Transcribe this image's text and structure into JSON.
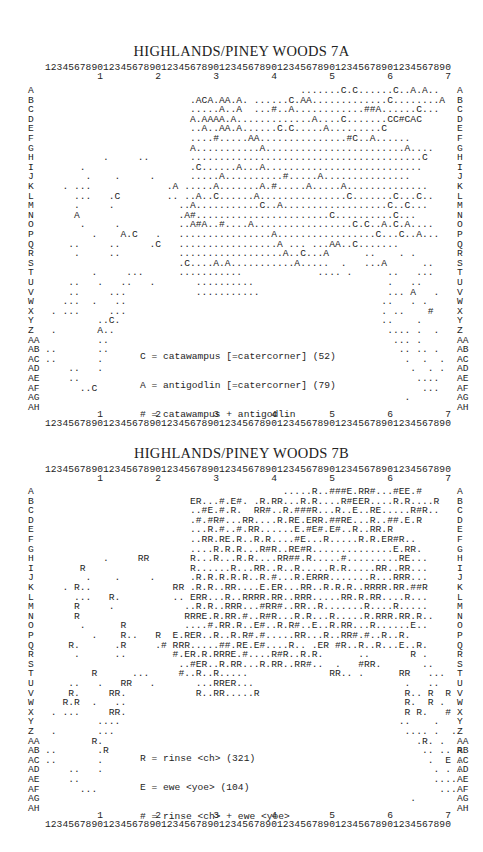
{
  "panels": [
    {
      "title": "HIGHLANDS/PINEY WOODS 7A",
      "axis_digits": "1234567890123456789012345678901234567890123456789012345678901234567890",
      "axis_tens": "         1         2         3         4         5         6         7",
      "row_labels": [
        "A",
        "B",
        "C",
        "D",
        "E",
        "F",
        "G",
        "H",
        "I",
        "J",
        "K",
        "L",
        "M",
        "N",
        "O",
        "P",
        "Q",
        "R",
        "S",
        "T",
        "U",
        "V",
        "W",
        "X",
        "Y",
        "Z",
        "AA",
        "AB",
        "AC",
        "AD",
        "AE",
        "AF",
        "AG",
        "AH"
      ],
      "rows": [
        "                                            .......C.C......C..A.A..   ",
        "                         .ACA.AA.A. ......C.AA.............C........A  ",
        "                         .....A..A  ...#..A............##A......C...   ",
        "                         A.AAAA.A.............A....C.......CC#CAC      ",
        "                         ..A..AA.A......C.C.....A.........C            ",
        "                         ....#.....AA...............#C..A......        ",
        "                         A...........A........................A....    ",
        "          .     ..       ........................................C     ",
        "      .                  .C......A...A...........................      ",
        "       .    .     .      .....A..........#.....A...............        ",
        "   . ...             .A .....A.......A.#.....A.....A..............     ",
        "     ...   .C        .. ..A..C......A...............C.......C...C..    ",
        "     .     .           ..A...........C..A..................C..C...     ",
        "     A                 .A#.......................C..........C...       ",
        "      .     .          ..A#A..#....A.................C.C..A.C.A....    ",
        "        .    A.C   .   ................A.................C...C..A...   ",
        "    ..     ..     .C   .................A ... ...AA..C.......          ",
        "     .     ..          ..................A..C...A      ..    . .       ",
        "                       .C....A.A...........A.....  .   ...A      ..    ",
        "        .     ...      ...........             .... .      ..   ...   ",
        "    ..   .   ..   .       ..........                       .   ..     ",
        "    ..     ...            ...........                      ... A   .  ",
        "   ...  .   ..                                            ..   . .    ",
        " . ...     ...                                            . ..    #   ",
        "         ..C.                                             ..    .     ",
        " .       A..                                               .... .  .  ",
        "         ..                                                 ... .     ",
        "..       ..                                                  .. .. .  ",
        "..       .                                                    .  .  . ",
        "    ..   .                                                     .  . . ",
        "    ..                                                          ....  ",
        "      ..C                                                        ...  ",
        "                                                              .       ",
        "                                                                      "
      ],
      "bottom_stray": ".",
      "legend": [
        {
          "symbol": "C",
          "text": "C = catawampus [=catercorner] (52)"
        },
        {
          "symbol": "A",
          "text": "A = antigodlin [=catercorner] (79)"
        },
        {
          "symbol": "#",
          "text": "# = catawampus + antigodlin"
        }
      ]
    },
    {
      "title": "HIGHLANDS/PINEY WOODS 7B",
      "axis_digits": "1234567890123456789012345678901234567890123456789012345678901234567890",
      "axis_tens": "         1         2         3         4         5         6         7",
      "row_labels": [
        "A",
        "B",
        "C",
        "D",
        "E",
        "F",
        "G",
        "H",
        "I",
        "J",
        "K",
        "L",
        "M",
        "N",
        "O",
        "P",
        "Q",
        "R",
        "S",
        "T",
        "U",
        "V",
        "W",
        "X",
        "Y",
        "Z",
        "AA",
        "AB",
        "AC",
        "AD",
        "AE",
        "AF",
        "AG",
        "AH"
      ],
      "rows": [
        "                                         .....R..###E.RR#...#EE.#      ",
        "                         ER...#.E#. .R.RR...R.R....R#EER....R.R....R   ",
        "                         ..#E.#.R.  RR#..R.###R...R..E..RE.....R#R..   ",
        "                         .#.#R#...RR....R.RE.ERR.##RE...R..##.E.R      ",
        "                         ...R.#..#.RR......E.#E#.E#..R..RR.R           ",
        "                         ..RR.RE.R..R.R....#E...R.....R.R.ER#R..       ",
        "                         ....R.R.R...R#R..RE#R..............E.RR.      ",
        "          .     RR       R...R...R.R....RR##.R.....#.........RE...     ",
        "      R                  R......R...RR..R..R.....R.R.....RR..RR...     ",
        "       .    .     .      .R.R.R.R.R..R.#...R.ERRR.......R...RRR...     ",
        "   . R..              RR .R.R..RR....E.ER...RR..R.R.R..RRRR.RR.##R     ",
        "     ...   R.         .. ERR...R..RRRR.RR..RRR.....RR.R.RR....R...     ",
        "     R     .            ..R.R..RRR...#RR#..RR..R.......R....R.....    ",
        "     R                  RRRE.R.RR.#..R#R...R.R...R.....R.RRR.RR.R..    ",
        "      .      R          ....#.RR.R..E#..R.R#..E..R.RR...R......E..     ",
        "        .    R..   R  E.RER..R..R.R#.#.....RR...R..RR#.#..R..R.        ",
        "    R.      .R     .# RRR.....##.RE.E#....R.. .ER #R..R..R...E..R.     ",
        "     .      ..        #.ER.R.RRRE.#....R#R..R.R.      ..       R .     ",
        "                       ..#ER..R.RR...R.RR..RR#..  .   #RR.       ..    ",
        "        R      ...     #..R..R.....              RR.. .      RR   ...  ",
        "    ..   .   RR   .       ...RRER...                          .   ..   ",
        "    R.     RR.            R..RR.....R                         R.. R  R ",
        "   R.R  .   ..                                                R.  R .  ",
        " . ...     RR.                                                R R.   # ",
        "         ....                                                ..    .   ",
        " .       ...                                                  .... .  . ",
        "        R.                                                      .R. .   ",
        "..       .R                                                      .. .. R",
        "..       .                                                        .  E .",
        "    ..   .                                                         . . .",
        "    ..                                                             .... ",
        "      ...                                                           ... ",
        "                                                               .        ",
        "                                                                        "
      ],
      "bottom_stray": ".",
      "legend": [
        {
          "symbol": "R",
          "text": "R = rinse <ch> (321)"
        },
        {
          "symbol": "E",
          "text": "E = ewe <yoe> (104)"
        },
        {
          "symbol": "#",
          "text": "# = rinse <ch> + ewe <yoe>"
        }
      ]
    }
  ]
}
